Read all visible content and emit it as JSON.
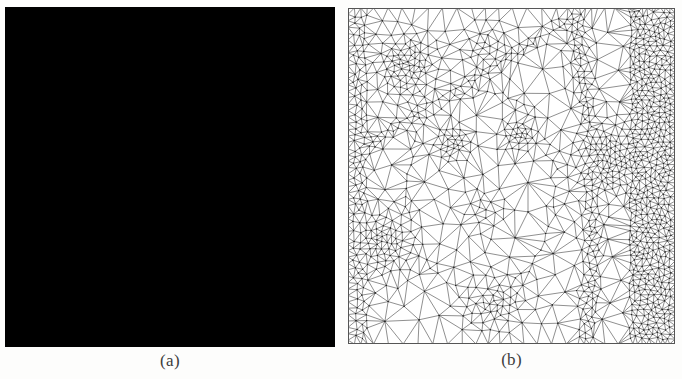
{
  "figure": {
    "background_color": "#fdfdfc",
    "ink_color": "#2b2b2b",
    "panels": [
      {
        "id": "a",
        "caption": "(a)",
        "kind": "grayscale-photograph",
        "subject": "lena-test-image",
        "description": "Halftone-scanned grayscale portrait test image (Lena) showing a woman wearing a wide brimmed feathered hat, face turned toward viewer, dark hair on right side.",
        "rect": {
          "x": 5,
          "y": 7,
          "width": 330,
          "height": 340
        },
        "tone_range": {
          "min": 0.04,
          "max": 0.99
        },
        "halftone": true
      },
      {
        "id": "b",
        "caption": "(b)",
        "kind": "triangular-mesh",
        "subject": "adaptive-delaunay-triangulation",
        "description": "Adaptive Delaunay triangular mesh generated from the image in (a). Triangle density follows image feature content: dense clusters over the hat feathers, eyes, hair and face contours; large coarse triangles over smooth low-gradient regions such as the cheek, forehead and shoulder.",
        "rect": {
          "x": 348,
          "y": 8,
          "width": 327,
          "height": 336
        },
        "edge_color": "#333333",
        "vertex_color": "#1a1a1a",
        "border": true
      }
    ],
    "bleed_text": "bleed-through from following text line"
  },
  "captions": {
    "panel_a_label": "(a)",
    "panel_b_label": "(b)"
  },
  "chart_data": {
    "type": "heatmap",
    "title": "",
    "xlabel": "",
    "ylabel": "",
    "grid": false,
    "legend": "none",
    "mesh_density_features": [
      {
        "name": "hat-feathers",
        "cx": 0.18,
        "cy": 0.17,
        "radius": 0.17,
        "density": 1.0
      },
      {
        "name": "hat-brim-edge",
        "cx": 0.42,
        "cy": 0.12,
        "radius": 0.13,
        "density": 0.8
      },
      {
        "name": "left-eye",
        "cx": 0.32,
        "cy": 0.4,
        "radius": 0.1,
        "density": 1.0
      },
      {
        "name": "right-eye",
        "cx": 0.52,
        "cy": 0.38,
        "radius": 0.1,
        "density": 1.0
      },
      {
        "name": "nose-mouth",
        "cx": 0.42,
        "cy": 0.6,
        "radius": 0.12,
        "density": 0.75
      },
      {
        "name": "hair-right",
        "cx": 0.8,
        "cy": 0.45,
        "radius": 0.2,
        "density": 1.0
      },
      {
        "name": "hair-left-lower",
        "cx": 0.1,
        "cy": 0.7,
        "radius": 0.18,
        "density": 0.95
      },
      {
        "name": "shoulder-contour",
        "cx": 0.45,
        "cy": 0.88,
        "radius": 0.16,
        "density": 0.85
      },
      {
        "name": "cheek-smooth",
        "cx": 0.38,
        "cy": 0.72,
        "radius": 0.14,
        "density": 0.15
      },
      {
        "name": "background-smooth",
        "cx": 0.7,
        "cy": 0.15,
        "radius": 0.15,
        "density": 0.2
      }
    ]
  }
}
